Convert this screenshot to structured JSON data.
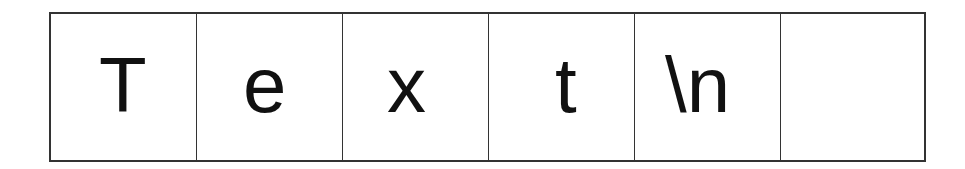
{
  "diagram": {
    "cells": [
      {
        "char": "T",
        "offset": 48
      },
      {
        "char": "e",
        "offset": 46
      },
      {
        "char": "x",
        "offset": 44
      },
      {
        "char": "t",
        "offset": 66
      },
      {
        "char": "\\n",
        "offset": 30
      },
      {
        "char": "",
        "offset": 0
      }
    ]
  }
}
